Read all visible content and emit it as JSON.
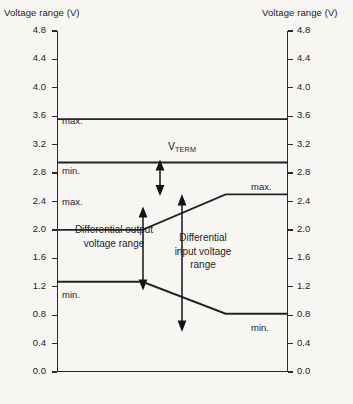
{
  "axis_titles": {
    "left": "Voltage range (V)",
    "right": "Voltage range (V)"
  },
  "annotations": {
    "vterm_max": "max.",
    "vterm_min": "min.",
    "output_max": "max.",
    "output_min": "min.",
    "input_max": "max.",
    "input_min": "min.",
    "vterm_symbol": "V",
    "vterm_subscript": "TERM",
    "output_range_line1": "Differential output",
    "output_range_line2": "voltage range",
    "input_range_line1": "Differential",
    "input_range_line2": "input voltage",
    "input_range_line3": "range"
  },
  "chart_data": {
    "type": "line",
    "title": "",
    "xlabel": "",
    "ylabel": "Voltage range (V)",
    "ylim": [
      0.0,
      4.8
    ],
    "xlim": [
      0,
      100
    ],
    "grid": false,
    "legend": "none",
    "y_ticks": [
      "4.8",
      "4.4",
      "4.0",
      "3.6",
      "3.2",
      "2.8",
      "2.4",
      "2.0",
      "1.6",
      "1.2",
      "0.8",
      "0.4",
      "0.0"
    ],
    "y_tick_values": [
      4.8,
      4.4,
      4.0,
      3.6,
      3.2,
      2.8,
      2.4,
      2.0,
      1.6,
      1.2,
      0.8,
      0.4,
      0.0
    ],
    "series": [
      {
        "name": "V_TERM max",
        "x": [
          0,
          100
        ],
        "values": [
          3.56,
          3.56
        ]
      },
      {
        "name": "V_TERM min",
        "x": [
          0,
          100
        ],
        "values": [
          2.95,
          2.95
        ]
      },
      {
        "name": "Differential output voltage range max / Differential input voltage range max",
        "x": [
          0,
          37,
          73,
          100
        ],
        "values": [
          2.0,
          2.0,
          2.5,
          2.5
        ]
      },
      {
        "name": "Differential output voltage range min / Differential input voltage range min",
        "x": [
          0,
          37,
          73,
          100
        ],
        "values": [
          1.27,
          1.27,
          0.82,
          0.82
        ]
      }
    ],
    "bands": [
      {
        "name": "V_TERM",
        "label": "V TERM",
        "top": 3.56,
        "bottom": 2.95
      },
      {
        "name": "Differential output voltage range",
        "top": 2.0,
        "bottom": 1.27
      },
      {
        "name": "Differential input voltage range",
        "top": 2.5,
        "bottom": 0.82
      }
    ]
  }
}
